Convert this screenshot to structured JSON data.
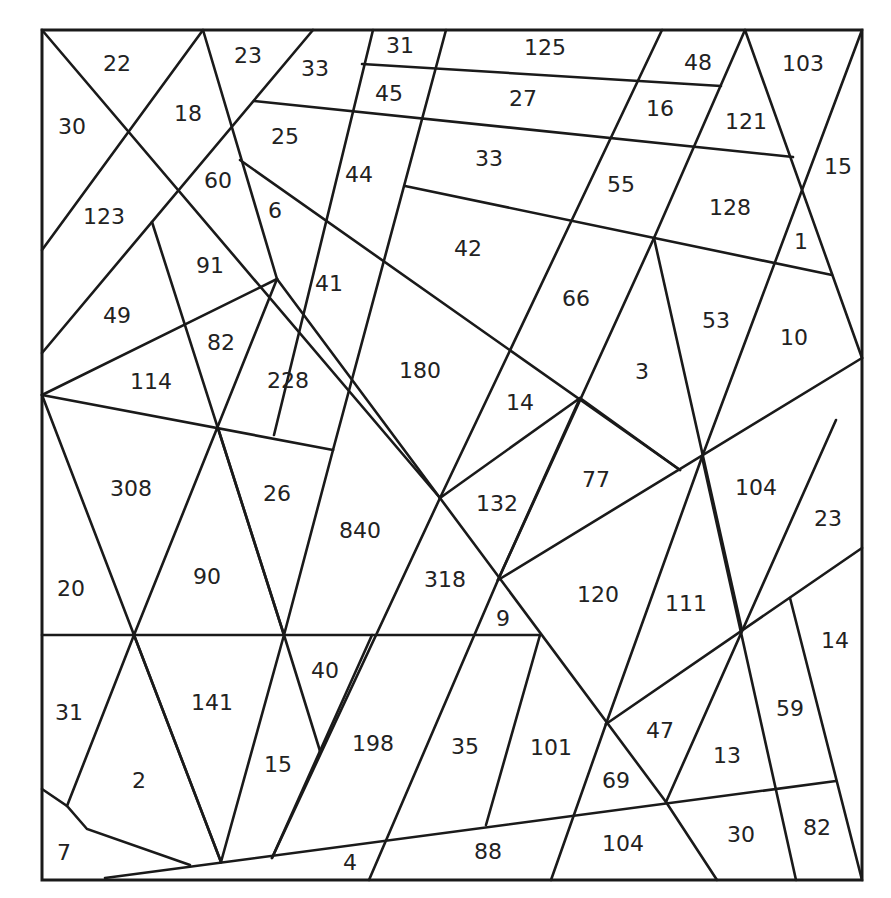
{
  "diagram": {
    "type": "area-puzzle",
    "line_color": "#1a1a1a",
    "background": "#ffffff",
    "regions": [
      {
        "label": "22",
        "x": 117,
        "y": 63
      },
      {
        "label": "23",
        "x": 248,
        "y": 55
      },
      {
        "label": "33",
        "x": 315,
        "y": 68
      },
      {
        "label": "31",
        "x": 400,
        "y": 45
      },
      {
        "label": "125",
        "x": 545,
        "y": 47
      },
      {
        "label": "48",
        "x": 698,
        "y": 62
      },
      {
        "label": "103",
        "x": 803,
        "y": 63
      },
      {
        "label": "30",
        "x": 72,
        "y": 126
      },
      {
        "label": "18",
        "x": 188,
        "y": 113
      },
      {
        "label": "45",
        "x": 389,
        "y": 93
      },
      {
        "label": "27",
        "x": 523,
        "y": 98
      },
      {
        "label": "16",
        "x": 660,
        "y": 108
      },
      {
        "label": "121",
        "x": 746,
        "y": 121
      },
      {
        "label": "25",
        "x": 285,
        "y": 136
      },
      {
        "label": "33",
        "x": 489,
        "y": 158
      },
      {
        "label": "15",
        "x": 838,
        "y": 166
      },
      {
        "label": "60",
        "x": 218,
        "y": 180
      },
      {
        "label": "44",
        "x": 359,
        "y": 174
      },
      {
        "label": "55",
        "x": 621,
        "y": 184
      },
      {
        "label": "128",
        "x": 730,
        "y": 207
      },
      {
        "label": "123",
        "x": 104,
        "y": 216
      },
      {
        "label": "6",
        "x": 275,
        "y": 210
      },
      {
        "label": "42",
        "x": 468,
        "y": 248
      },
      {
        "label": "1",
        "x": 801,
        "y": 241
      },
      {
        "label": "91",
        "x": 210,
        "y": 265
      },
      {
        "label": "41",
        "x": 329,
        "y": 283
      },
      {
        "label": "66",
        "x": 576,
        "y": 298
      },
      {
        "label": "49",
        "x": 117,
        "y": 315
      },
      {
        "label": "53",
        "x": 716,
        "y": 320
      },
      {
        "label": "10",
        "x": 794,
        "y": 337
      },
      {
        "label": "82",
        "x": 221,
        "y": 342
      },
      {
        "label": "114",
        "x": 151,
        "y": 381
      },
      {
        "label": "228",
        "x": 288,
        "y": 380
      },
      {
        "label": "180",
        "x": 420,
        "y": 370
      },
      {
        "label": "3",
        "x": 642,
        "y": 371
      },
      {
        "label": "14",
        "x": 520,
        "y": 402
      },
      {
        "label": "308",
        "x": 131,
        "y": 488
      },
      {
        "label": "26",
        "x": 277,
        "y": 493
      },
      {
        "label": "77",
        "x": 596,
        "y": 479
      },
      {
        "label": "104",
        "x": 756,
        "y": 487
      },
      {
        "label": "840",
        "x": 360,
        "y": 530
      },
      {
        "label": "132",
        "x": 497,
        "y": 503
      },
      {
        "label": "23",
        "x": 828,
        "y": 518
      },
      {
        "label": "20",
        "x": 71,
        "y": 588
      },
      {
        "label": "90",
        "x": 207,
        "y": 576
      },
      {
        "label": "318",
        "x": 445,
        "y": 579
      },
      {
        "label": "120",
        "x": 598,
        "y": 594
      },
      {
        "label": "111",
        "x": 686,
        "y": 603
      },
      {
        "label": "9",
        "x": 503,
        "y": 618
      },
      {
        "label": "14",
        "x": 835,
        "y": 640
      },
      {
        "label": "40",
        "x": 325,
        "y": 670
      },
      {
        "label": "31",
        "x": 69,
        "y": 712
      },
      {
        "label": "141",
        "x": 212,
        "y": 702
      },
      {
        "label": "59",
        "x": 790,
        "y": 708
      },
      {
        "label": "47",
        "x": 660,
        "y": 730
      },
      {
        "label": "198",
        "x": 373,
        "y": 743
      },
      {
        "label": "35",
        "x": 465,
        "y": 746
      },
      {
        "label": "101",
        "x": 551,
        "y": 747
      },
      {
        "label": "13",
        "x": 727,
        "y": 755
      },
      {
        "label": "15",
        "x": 278,
        "y": 764
      },
      {
        "label": "2",
        "x": 139,
        "y": 780
      },
      {
        "label": "69",
        "x": 616,
        "y": 780
      },
      {
        "label": "82",
        "x": 817,
        "y": 827
      },
      {
        "label": "30",
        "x": 741,
        "y": 834
      },
      {
        "label": "104",
        "x": 623,
        "y": 843
      },
      {
        "label": "88",
        "x": 488,
        "y": 851
      },
      {
        "label": "7",
        "x": 64,
        "y": 852
      },
      {
        "label": "4",
        "x": 350,
        "y": 862
      }
    ]
  }
}
